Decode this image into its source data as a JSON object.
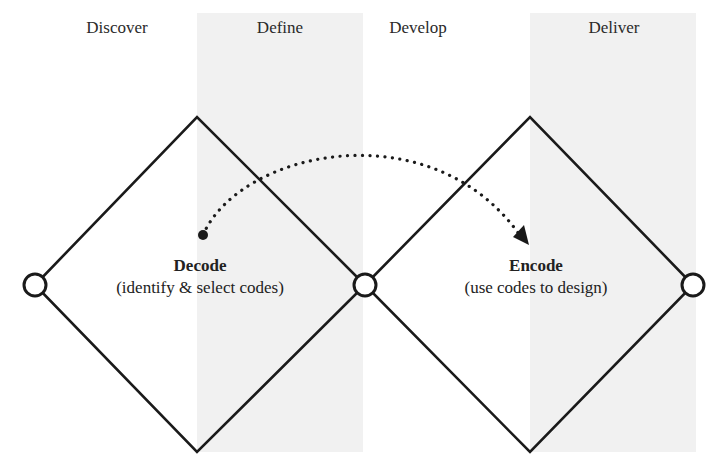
{
  "diagram": {
    "colors": {
      "line": "#1a1a1a",
      "shade": "#f1f1f1",
      "node_fill": "#ffffff",
      "background": "#ffffff"
    },
    "phases": [
      {
        "label": "Discover",
        "shaded": false
      },
      {
        "label": "Define",
        "shaded": true
      },
      {
        "label": "Develop",
        "shaded": false
      },
      {
        "label": "Deliver",
        "shaded": true
      }
    ],
    "diamonds": [
      {
        "title": "Decode",
        "subtitle": "(identify & select codes)"
      },
      {
        "title": "Encode",
        "subtitle": "(use codes to design)"
      }
    ],
    "nodes": [
      "start",
      "middle",
      "end"
    ],
    "connector": {
      "from": "Decode",
      "to": "Encode",
      "style": "dotted-arc-with-arrowhead"
    }
  }
}
